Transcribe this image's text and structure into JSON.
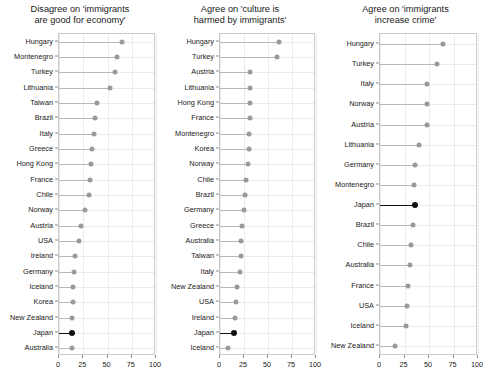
{
  "figure": {
    "background": "#ffffff",
    "dot_color": "#9a9a9a",
    "highlight_color": "#111111",
    "grid_color": "#ebebeb",
    "axis_color": "#c9c9c9"
  },
  "chart_data": [
    {
      "type": "scatter",
      "title": "Disagree on 'immigrants\nare good for economy'",
      "title_line1": "Disagree on 'immigrants",
      "title_line2": "are good for economy'",
      "xlabel": "",
      "ylabel": "",
      "xlim": [
        0,
        100
      ],
      "xticks": [
        0,
        25,
        50,
        75,
        100
      ],
      "xticklabels": [
        "0",
        "25",
        "50",
        "75",
        "100"
      ],
      "grid": true,
      "legend": "none",
      "highlight": "Japan",
      "categories": [
        "Hungary",
        "Montenegro",
        "Turkey",
        "Lithuania",
        "Taiwan",
        "Brazil",
        "Italy",
        "Greece",
        "Hong Kong",
        "France",
        "Chile",
        "Norway",
        "Austria",
        "USA",
        "Ireland",
        "Germany",
        "Iceland",
        "Korea",
        "New Zealand",
        "Japan",
        "Australia"
      ],
      "values": [
        65.0,
        59.5,
        58.0,
        53.0,
        39.0,
        36.8,
        35.7,
        33.7,
        33.0,
        31.6,
        31.3,
        26.8,
        23.0,
        20.3,
        16.5,
        15.5,
        14.4,
        14.4,
        13.4,
        13.4,
        13.0
      ]
    },
    {
      "type": "scatter",
      "title": "Agree on 'culture is\nharmed by immigrants'",
      "title_line1": "Agree on 'culture is",
      "title_line2": "harmed by immigrants'",
      "xlabel": "",
      "ylabel": "",
      "xlim": [
        0,
        100
      ],
      "xticks": [
        0,
        25,
        50,
        75,
        100
      ],
      "xticklabels": [
        "0",
        "25",
        "50",
        "75",
        "100"
      ],
      "grid": true,
      "legend": "none",
      "highlight": "Japan",
      "categories": [
        "Hungary",
        "Turkey",
        "Austria",
        "Lithuania",
        "Hong Kong",
        "France",
        "Montenegro",
        "Korea",
        "Norway",
        "Chile",
        "Brazil",
        "Germany",
        "Greece",
        "Australia",
        "Taiwan",
        "Italy",
        "New Zealand",
        "USA",
        "Ireland",
        "Japan",
        "Iceland"
      ],
      "values": [
        61.0,
        59.0,
        31.6,
        31.5,
        31.4,
        31.0,
        30.5,
        30.2,
        29.2,
        27.0,
        25.7,
        25.0,
        23.0,
        22.3,
        21.5,
        20.8,
        17.4,
        16.7,
        16.0,
        14.6,
        8.3
      ]
    },
    {
      "type": "scatter",
      "title": "Agree on 'immigrants\nincrease crime'",
      "title_line1": "Agree on 'immigrants",
      "title_line2": "increase crime'",
      "xlabel": "",
      "ylabel": "",
      "xlim": [
        0,
        100
      ],
      "xticks": [
        0,
        25,
        50,
        75,
        100
      ],
      "xticklabels": [
        "0",
        "25",
        "50",
        "75",
        "100"
      ],
      "grid": true,
      "legend": "none",
      "highlight": "Japan",
      "categories": [
        "Hungary",
        "Turkey",
        "Italy",
        "Norway",
        "Austria",
        "Lithuania",
        "Germany",
        "Montenegro",
        "Japan",
        "Brazil",
        "Chile",
        "Australia",
        "France",
        "USA",
        "Iceland",
        "New Zealand"
      ],
      "values": [
        64.6,
        57.8,
        48.3,
        48.2,
        47.6,
        39.4,
        35.7,
        34.7,
        35.4,
        33.3,
        32.0,
        30.9,
        28.5,
        27.6,
        26.5,
        15.6
      ]
    }
  ],
  "panels_layout": [
    {
      "panel_left": 0,
      "panel_width": 160,
      "plot_left": 58,
      "plot_right": 155,
      "plot_top": 33,
      "plot_bottom": 355
    },
    {
      "panel_left": 160,
      "panel_width": 160,
      "plot_left": 219,
      "plot_right": 315,
      "plot_top": 33,
      "plot_bottom": 355
    },
    {
      "panel_left": 320,
      "panel_width": 171,
      "plot_left": 379,
      "plot_right": 477,
      "plot_top": 33,
      "plot_bottom": 355
    }
  ]
}
